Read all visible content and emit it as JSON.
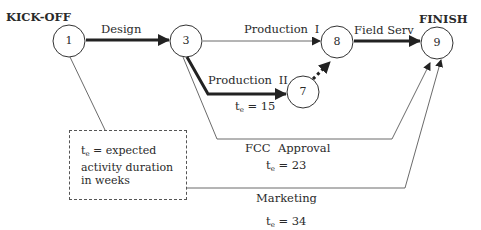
{
  "diagram": {
    "type": "PERT network",
    "start_label": "KICK-OFF",
    "end_label": "FINISH",
    "nodes": [
      {
        "id": "1",
        "label": "1"
      },
      {
        "id": "3",
        "label": "3"
      },
      {
        "id": "7",
        "label": "7"
      },
      {
        "id": "8",
        "label": "8"
      },
      {
        "id": "9",
        "label": "9"
      }
    ],
    "activities": [
      {
        "from": "1",
        "to": "3",
        "label": "Design",
        "critical": true
      },
      {
        "from": "3",
        "to": "8",
        "label": "Production I",
        "critical": false
      },
      {
        "from": "3",
        "to": "7",
        "label": "Production II",
        "critical": true,
        "te_prefix": "t",
        "te_sub": "e",
        "te_value": " = 15"
      },
      {
        "from": "7",
        "to": "8",
        "label": "",
        "critical": true,
        "dummy": true
      },
      {
        "from": "8",
        "to": "9",
        "label": "Field Serv",
        "critical": true
      },
      {
        "from": "3",
        "to": "9",
        "label": "FCC  Approval",
        "critical": false,
        "te_prefix": "t",
        "te_sub": "e",
        "te_value": " = 23"
      },
      {
        "from": "1",
        "to": "9",
        "label": "Marketing",
        "critical": false,
        "te_prefix": "t",
        "te_sub": "e",
        "te_value": " = 34"
      }
    ],
    "legend": {
      "prefix": "t",
      "sub": "e",
      "line1": " = expected",
      "line2": "activity duration",
      "line3": "in weeks"
    }
  }
}
